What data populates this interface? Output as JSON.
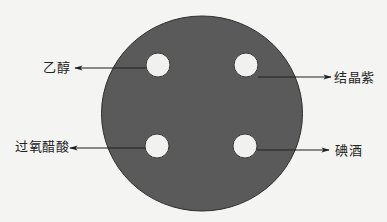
{
  "diagram": {
    "plate": {
      "cx": 202,
      "cy": 113.5,
      "rx": 100.5,
      "ry": 97.5,
      "fill": "#5a5a5a",
      "stroke": "#2e2e2e"
    },
    "disc_fill": "#f1f1ef",
    "disc_stroke": "#3a3a3a",
    "line_color": "#1e1e1e",
    "discs": [
      {
        "id": "top-left",
        "cx": 158,
        "cy": 65,
        "r": 12,
        "label": "乙醇"
      },
      {
        "id": "top-right",
        "cx": 246,
        "cy": 65,
        "r": 12,
        "label": "结晶紫"
      },
      {
        "id": "bottom-left",
        "cx": 157,
        "cy": 146,
        "r": 12,
        "label": "过氧醋酸"
      },
      {
        "id": "bottom-right",
        "cx": 245,
        "cy": 146,
        "r": 12,
        "label": "碘酒"
      }
    ],
    "arrows": [
      {
        "x1": 146,
        "y1": 68,
        "x2": 75,
        "y2": 68
      },
      {
        "x1": 258,
        "y1": 77,
        "x2": 331,
        "y2": 77
      },
      {
        "x1": 145,
        "y1": 148,
        "x2": 70,
        "y2": 148
      },
      {
        "x1": 257,
        "y1": 150,
        "x2": 329,
        "y2": 150
      }
    ],
    "labels": {
      "ethanol": "乙醇",
      "crystal_violet": "结晶紫",
      "peracetic_acid": "过氧醋酸",
      "iodine_tincture": "碘酒"
    }
  }
}
